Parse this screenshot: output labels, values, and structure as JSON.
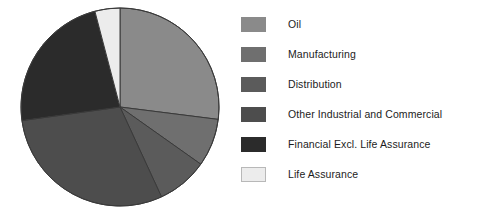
{
  "chart_data": {
    "type": "pie",
    "title": "",
    "subtitle": "",
    "xlabel": "",
    "ylabel": "",
    "legend_position": "right",
    "grid": false,
    "start_angle_deg": 0,
    "direction": "clockwise",
    "categories": [
      "Oil",
      "Manufacturing",
      "Distribution",
      "Other Industrial and Commercial",
      "Financial Excl. Life Assurance",
      "Life Assurance"
    ],
    "values": [
      27.0,
      7.8,
      8.3,
      29.7,
      23.1,
      4.1
    ],
    "value_unit": "percent",
    "colors": [
      "#8a8a8a",
      "#6f6f6f",
      "#5b5b5b",
      "#4d4d4d",
      "#2b2b2b",
      "#ececec"
    ],
    "slices": [
      {
        "label": "Oil",
        "value": 27.0,
        "start_deg": 0.0,
        "end_deg": 97.2,
        "color": "#8a8a8a"
      },
      {
        "label": "Manufacturing",
        "value": 7.8,
        "start_deg": 97.2,
        "end_deg": 125.3,
        "color": "#6f6f6f"
      },
      {
        "label": "Distribution",
        "value": 8.3,
        "start_deg": 125.3,
        "end_deg": 155.2,
        "color": "#5b5b5b"
      },
      {
        "label": "Other Industrial and Commercial",
        "value": 29.7,
        "start_deg": 155.2,
        "end_deg": 262.1,
        "color": "#4d4d4d"
      },
      {
        "label": "Financial Excl. Life Assurance",
        "value": 23.1,
        "start_deg": 262.1,
        "end_deg": 345.3,
        "color": "#2b2b2b"
      },
      {
        "label": "Life Assurance",
        "value": 4.1,
        "start_deg": 345.3,
        "end_deg": 360.0,
        "color": "#ececec"
      }
    ]
  },
  "pie": {
    "center_x": 120,
    "center_y": 107,
    "radius": 99,
    "outline_color": "#3a3a3a"
  },
  "legend": {
    "items": [
      {
        "label": "Oil",
        "color": "#8a8a8a"
      },
      {
        "label": "Manufacturing",
        "color": "#6f6f6f"
      },
      {
        "label": "Distribution",
        "color": "#5b5b5b"
      },
      {
        "label": "Other Industrial and Commercial",
        "color": "#4d4d4d"
      },
      {
        "label": "Financial Excl. Life Assurance",
        "color": "#2b2b2b"
      },
      {
        "label": "Life Assurance",
        "color": "#ececec"
      }
    ]
  }
}
